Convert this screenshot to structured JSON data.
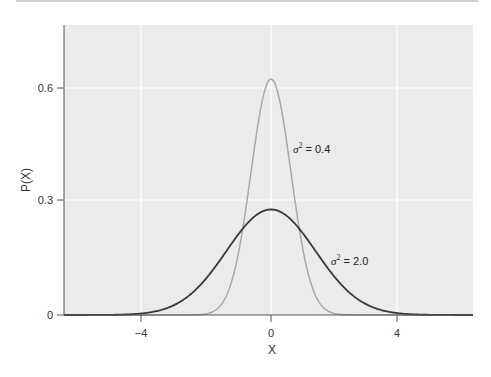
{
  "chart_data": {
    "type": "line",
    "title": "",
    "xlabel": "X",
    "ylabel": "P(X)",
    "xlim": [
      -6.5,
      6.5
    ],
    "ylim": [
      0,
      0.77
    ],
    "grid": true,
    "x_ticks": [
      -4,
      0,
      4
    ],
    "x_tick_labels": [
      "−4",
      "0",
      "4"
    ],
    "y_ticks": [
      0,
      0.3,
      0.6
    ],
    "y_tick_labels": [
      "0",
      "0.3",
      "0.6"
    ],
    "series": [
      {
        "name": "σ² = 0.4",
        "mean": 0,
        "variance": 0.4,
        "peak": 0.63,
        "color": "#a8a8a8",
        "x": [
          -3,
          -2,
          -1.5,
          -1,
          -0.5,
          0,
          0.5,
          1,
          1.5,
          2,
          3
        ],
        "values": [
          0.0,
          0.0043,
          0.0381,
          0.1803,
          0.4622,
          0.6308,
          0.4622,
          0.1803,
          0.0381,
          0.0043,
          0.0
        ]
      },
      {
        "name": "σ² = 2.0",
        "mean": 0,
        "variance": 2.0,
        "peak": 0.28,
        "color": "#3a3a3a",
        "x": [
          -6,
          -4,
          -3,
          -2,
          -1,
          0,
          1,
          2,
          3,
          4,
          6
        ],
        "values": [
          0.0003,
          0.0052,
          0.0297,
          0.1038,
          0.2197,
          0.2821,
          0.2197,
          0.1038,
          0.0297,
          0.0052,
          0.0003
        ]
      }
    ],
    "annotations": [
      {
        "text": "σ² = 0.4",
        "x": 0.7,
        "y": 0.45
      },
      {
        "text": "σ² = 2.0",
        "x": 1.9,
        "y": 0.145
      }
    ]
  },
  "labels": {
    "ylabel": "P(X)",
    "xlabel": "X",
    "xticks": [
      "−4",
      "0",
      "4"
    ],
    "yticks": [
      "0",
      "0.3",
      "0.6"
    ],
    "annot_narrow_sigma": "σ",
    "annot_narrow_sup": "2",
    "annot_narrow_val": " = 0.4",
    "annot_wide_sigma": "σ",
    "annot_wide_sup": "2",
    "annot_wide_val": " = 2.0"
  }
}
